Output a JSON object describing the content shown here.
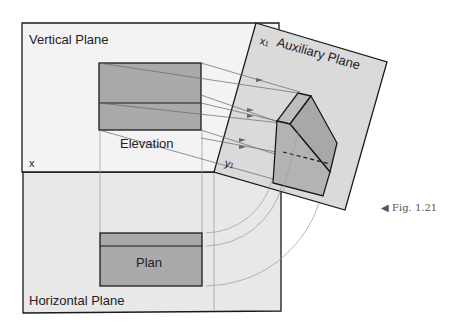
{
  "labels": {
    "vertical_plane": "Vertical Plane",
    "horizontal_plane": "Horizontal Plane",
    "auxiliary_plane": "Auxiliary Plane",
    "elevation": "Elevation",
    "plan": "Plan",
    "x": "x",
    "x1": "x",
    "x1_sub": "1",
    "y1": "y",
    "y1_sub": "1",
    "figure_ref": "Fig. 1.21",
    "figure_marker": "◀"
  },
  "colors": {
    "plane_fill": "#ececec",
    "horizontal_fill": "#e6e6e6",
    "aux_fill": "#d9d9d9",
    "view_fill": "#a9a9a9",
    "object_fill_light": "#b8b8b8",
    "object_fill_dark": "#a3a3a3",
    "outline": "#1a1a1a",
    "projector": "#777777"
  }
}
